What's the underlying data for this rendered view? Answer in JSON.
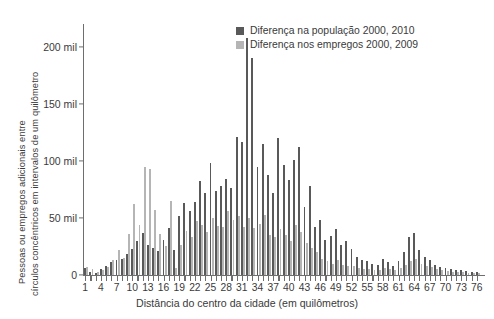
{
  "chart_data": {
    "type": "bar",
    "title": "",
    "xlabel": "Distância do centro da cidade (em quilômetros)",
    "ylabel_line1": "Pessoas ou empregos adicionais entre",
    "ylabel_line2": "círculos concêntricos em intervalos de um quilômetro",
    "ylim": [
      0,
      220000
    ],
    "yticks": [
      0,
      50000,
      100000,
      150000,
      200000
    ],
    "ytick_labels": [
      "0",
      "50 mil",
      "100 mil",
      "150 mil",
      "200 mil"
    ],
    "xlim": [
      0.5,
      76.5
    ],
    "xticks_every": 1,
    "xtick_label_step": 3,
    "xtick_labels": [
      "1",
      "4",
      "7",
      "10",
      "13",
      "16",
      "19",
      "22",
      "25",
      "28",
      "31",
      "34",
      "37",
      "40",
      "43",
      "46",
      "49",
      "52",
      "55",
      "58",
      "61",
      "64",
      "67",
      "70",
      "73",
      "76"
    ],
    "grid": false,
    "legend_position": "top-right",
    "colors": {
      "populacao": "#595959",
      "empregos": "#b5b5b5",
      "axis": "#6e6e6e",
      "text": "#3a3a3a",
      "background": "#ffffff"
    },
    "categories": [
      1,
      2,
      3,
      4,
      5,
      6,
      7,
      8,
      9,
      10,
      11,
      12,
      13,
      14,
      15,
      16,
      17,
      18,
      19,
      20,
      21,
      22,
      23,
      24,
      25,
      26,
      27,
      28,
      29,
      30,
      31,
      32,
      33,
      34,
      35,
      36,
      37,
      38,
      39,
      40,
      41,
      42,
      43,
      44,
      45,
      46,
      47,
      48,
      49,
      50,
      51,
      52,
      53,
      54,
      55,
      56,
      57,
      58,
      59,
      60,
      61,
      62,
      63,
      64,
      65,
      66,
      67,
      68,
      69,
      70,
      71,
      72,
      73,
      74,
      75,
      76
    ],
    "series": [
      {
        "name": "Diferença na população 2000, 2010",
        "color": "#595959",
        "values": [
          6000,
          3000,
          2000,
          5000,
          8000,
          11000,
          13000,
          14000,
          18000,
          23000,
          30000,
          37000,
          26000,
          24000,
          21000,
          31000,
          41000,
          22000,
          52000,
          63000,
          56000,
          64000,
          82000,
          72000,
          98000,
          74000,
          78000,
          84000,
          76000,
          121000,
          117000,
          208000,
          190000,
          95000,
          115000,
          88000,
          72000,
          120000,
          96000,
          83000,
          101000,
          112000,
          60000,
          78000,
          42000,
          48000,
          31000,
          34000,
          40000,
          26000,
          30000,
          23000,
          16000,
          13000,
          12000,
          10000,
          9000,
          14000,
          11000,
          8000,
          12000,
          20000,
          33000,
          37000,
          22000,
          16000,
          13000,
          9000,
          7000,
          6000,
          5000,
          4000,
          4000,
          3500,
          3000,
          2500
        ]
      },
      {
        "name": "Diferença nos empregos 2000, 2009",
        "color": "#b5b5b5",
        "values": [
          7000,
          5000,
          3000,
          4000,
          7000,
          13000,
          22000,
          15000,
          36000,
          62000,
          44000,
          95000,
          93000,
          57000,
          36000,
          25000,
          65000,
          6000,
          26000,
          39000,
          33000,
          47000,
          44000,
          38000,
          50000,
          43000,
          42000,
          56000,
          48000,
          52000,
          42000,
          50000,
          41000,
          45000,
          53000,
          35000,
          33000,
          40000,
          35000,
          30000,
          44000,
          38000,
          28000,
          24000,
          20000,
          14000,
          12000,
          10000,
          13000,
          9000,
          8000,
          8000,
          6000,
          5500,
          5000,
          4500,
          4000,
          6000,
          5000,
          4000,
          6000,
          9000,
          12000,
          14000,
          10000,
          8000,
          7000,
          5000,
          4000,
          3500,
          3000,
          2500,
          2500,
          2000,
          2000,
          1500
        ]
      }
    ]
  },
  "legend": {
    "items": [
      {
        "label": "Diferença na população 2000, 2010",
        "swatch": "pop"
      },
      {
        "label": "Diferença nos empregos 2000, 2009",
        "swatch": "job"
      }
    ]
  }
}
